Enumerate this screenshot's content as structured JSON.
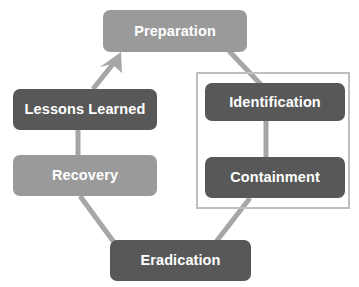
{
  "diagram": {
    "background_color": "#ffffff",
    "connector_color": "#a6a6a6",
    "group_frame_color": "#bfbfbf",
    "label_color": "#ffffff",
    "nodes": [
      {
        "id": "preparation",
        "label": "Preparation",
        "fill": "#9a9a9a",
        "x": 103,
        "y": 10,
        "width": 144,
        "height": 42
      },
      {
        "id": "lessons-learned",
        "label": "Lessons Learned",
        "fill": "#585858",
        "x": 13,
        "y": 89,
        "width": 144,
        "height": 41
      },
      {
        "id": "recovery",
        "label": "Recovery",
        "fill": "#9a9a9a",
        "x": 13,
        "y": 155,
        "width": 144,
        "height": 41
      },
      {
        "id": "identification",
        "label": "Identification",
        "fill": "#585858",
        "x": 205,
        "y": 83,
        "width": 140,
        "height": 38
      },
      {
        "id": "containment",
        "label": "Containment",
        "fill": "#585858",
        "x": 205,
        "y": 157,
        "width": 140,
        "height": 41
      },
      {
        "id": "eradication",
        "label": "Eradication",
        "fill": "#585858",
        "x": 110,
        "y": 240,
        "width": 141,
        "height": 41
      }
    ],
    "group_frame": {
      "id": "detection-analysis-group",
      "x": 196,
      "y": 72,
      "width": 154,
      "height": 137
    },
    "connectors": [
      {
        "id": "lessons-learned-to-preparation",
        "from": "lessons-learned",
        "to": "preparation",
        "arrowhead": true
      },
      {
        "id": "preparation-to-identification",
        "from": "preparation",
        "to": "identification",
        "arrowhead": false
      },
      {
        "id": "identification-to-containment",
        "from": "identification",
        "to": "containment",
        "arrowhead": false
      },
      {
        "id": "containment-to-eradication",
        "from": "containment",
        "to": "eradication",
        "arrowhead": false
      },
      {
        "id": "eradication-to-recovery",
        "from": "eradication",
        "to": "recovery",
        "arrowhead": false
      },
      {
        "id": "recovery-to-lessons-learned",
        "from": "recovery",
        "to": "lessons-learned",
        "arrowhead": false
      }
    ]
  }
}
